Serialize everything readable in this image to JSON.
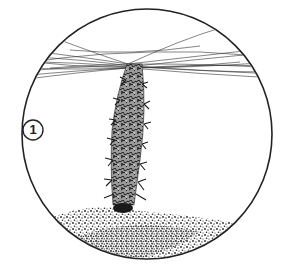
{
  "figure": {
    "label": "1",
    "colors": {
      "ink": "#222222",
      "background": "#ffffff",
      "web": "#333333",
      "column": "#2a2a2a",
      "column_light": "#8a8a8a"
    },
    "outer_circle": {
      "cx": 147,
      "cy": 134,
      "r": 125
    },
    "label_circle": {
      "cx": 33,
      "cy": 130,
      "r": 10
    }
  }
}
